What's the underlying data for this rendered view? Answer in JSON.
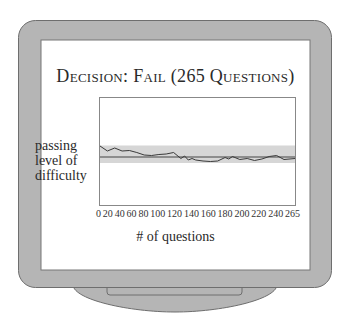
{
  "title": "Decision: Fail (265 Questions)",
  "colors": {
    "frame": "#b5b5b5",
    "frame_outline": "#6e6e6e",
    "screen": "#ffffff",
    "band": "#d6d6d6",
    "line": "#3a3a3a"
  },
  "chart_data": {
    "type": "line",
    "title": "Decision: Fail (265 Questions)",
    "xlabel": "# of questions",
    "ylabel": "passing level of difficulty",
    "x_tick_labels": [
      "0",
      "20",
      "40",
      "60",
      "80",
      "100",
      "120",
      "140",
      "160",
      "180",
      "200",
      "220",
      "240",
      "265"
    ],
    "xlim": [
      0,
      265
    ],
    "ylim_note": "no numeric y-axis; values relative to passing level (0 = passing level, positive = above)",
    "grid": false,
    "legend": null,
    "passing_level": 0,
    "confidence_band": [
      -1.2,
      2.3
    ],
    "series": [
      {
        "name": "ability estimate",
        "x": [
          0,
          10,
          20,
          30,
          40,
          50,
          60,
          70,
          80,
          90,
          100,
          110,
          115,
          120,
          125,
          130,
          140,
          150,
          160,
          170,
          175,
          180,
          190,
          200,
          210,
          220,
          230,
          240,
          250,
          265
        ],
        "values": [
          2.2,
          1.2,
          1.8,
          1.2,
          1.3,
          0.9,
          0.4,
          0.3,
          0.5,
          0.6,
          0.9,
          -0.3,
          0.2,
          -0.6,
          -0.3,
          -0.6,
          -0.8,
          -0.9,
          -0.8,
          -0.1,
          -0.4,
          0.1,
          -0.5,
          -0.3,
          -0.7,
          -0.4,
          0.1,
          0.3,
          -0.5,
          -0.3
        ]
      }
    ]
  },
  "axis": {
    "ylabel_lines": [
      "passing",
      "level of",
      "difficulty"
    ],
    "xlabel": "# of questions",
    "ticks": [
      "0",
      "20",
      "40",
      "60",
      "80",
      "100",
      "120",
      "140",
      "160",
      "180",
      "200",
      "220",
      "240",
      "265"
    ]
  }
}
